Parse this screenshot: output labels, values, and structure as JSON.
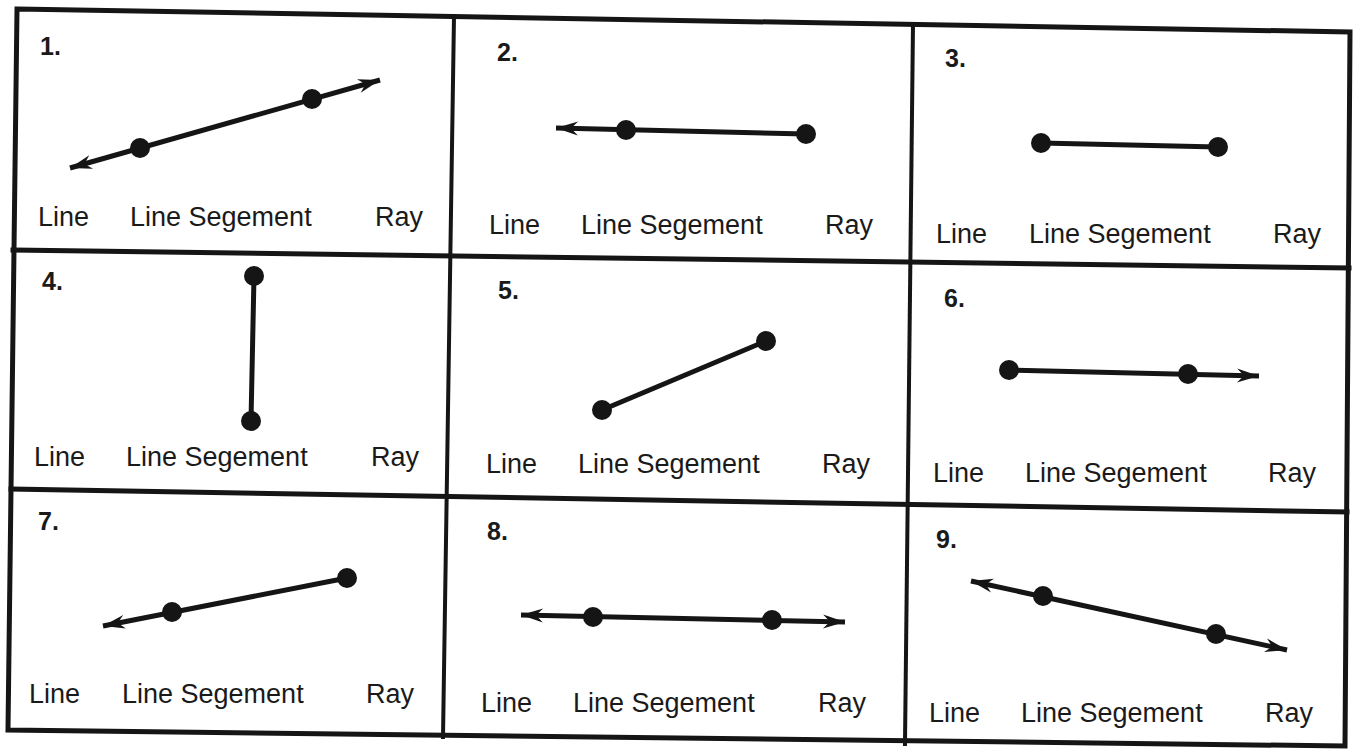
{
  "worksheet": {
    "answer_options": [
      "Line",
      "Line Segement",
      "Ray"
    ],
    "colors": {
      "ink": "#151515",
      "paper": "#ffffff"
    },
    "problems": [
      {
        "number": "1.",
        "figure_type": "line",
        "points": [
          [
            140,
            148
          ],
          [
            312,
            99
          ]
        ],
        "arrows": [
          [
            70,
            168
          ],
          [
            380,
            80
          ]
        ],
        "num_pos": [
          40,
          55
        ],
        "opt_y": 226,
        "opt_x": [
          38,
          130,
          375
        ]
      },
      {
        "number": "2.",
        "figure_type": "ray",
        "points": [
          [
            626,
            130
          ],
          [
            806,
            134
          ]
        ],
        "arrows": [
          [
            556,
            128
          ]
        ],
        "num_pos": [
          497,
          61
        ],
        "opt_y": 234,
        "opt_x": [
          489,
          581,
          825
        ]
      },
      {
        "number": "3.",
        "figure_type": "segment",
        "points": [
          [
            1041,
            143
          ],
          [
            1218,
            147
          ]
        ],
        "arrows": [],
        "num_pos": [
          945,
          67
        ],
        "opt_y": 243,
        "opt_x": [
          936,
          1029,
          1273
        ]
      },
      {
        "number": "4.",
        "figure_type": "segment",
        "points": [
          [
            254,
            276
          ],
          [
            251,
            421
          ]
        ],
        "arrows": [],
        "num_pos": [
          42,
          290
        ],
        "opt_y": 466,
        "opt_x": [
          34,
          126,
          371
        ]
      },
      {
        "number": "5.",
        "figure_type": "segment",
        "points": [
          [
            602,
            410
          ],
          [
            766,
            341
          ]
        ],
        "arrows": [],
        "num_pos": [
          498,
          299
        ],
        "opt_y": 473,
        "opt_x": [
          486,
          578,
          822
        ]
      },
      {
        "number": "6.",
        "figure_type": "ray",
        "points": [
          [
            1009,
            370
          ],
          [
            1188,
            374
          ]
        ],
        "arrows": [
          [
            1259,
            376
          ]
        ],
        "num_pos": [
          944,
          307
        ],
        "opt_y": 482,
        "opt_x": [
          933,
          1025,
          1268
        ]
      },
      {
        "number": "7.",
        "figure_type": "ray",
        "points": [
          [
            172,
            612
          ],
          [
            347,
            578
          ]
        ],
        "arrows": [
          [
            103,
            626
          ]
        ],
        "num_pos": [
          38,
          530
        ],
        "opt_y": 703,
        "opt_x": [
          29,
          122,
          366
        ]
      },
      {
        "number": "8.",
        "figure_type": "line",
        "points": [
          [
            593,
            617
          ],
          [
            772,
            620
          ]
        ],
        "arrows": [
          [
            521,
            615
          ],
          [
            845,
            622
          ]
        ],
        "num_pos": [
          487,
          540
        ],
        "opt_y": 712,
        "opt_x": [
          481,
          573,
          818
        ]
      },
      {
        "number": "9.",
        "figure_type": "line",
        "points": [
          [
            1043,
            596
          ],
          [
            1216,
            634
          ]
        ],
        "arrows": [
          [
            971,
            581
          ],
          [
            1287,
            650
          ]
        ],
        "num_pos": [
          936,
          548
        ],
        "opt_y": 722,
        "opt_x": [
          929,
          1021,
          1265
        ]
      }
    ]
  }
}
